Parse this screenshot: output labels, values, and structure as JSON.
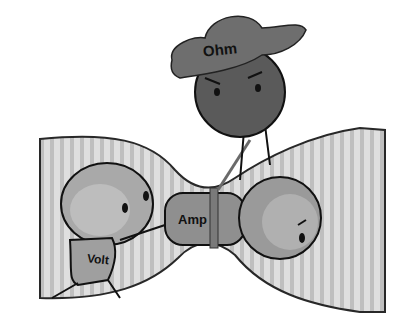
{
  "illustration": {
    "subject": "Ohm's law cartoon",
    "characters": [
      {
        "name": "Ohm",
        "label": "Ohm",
        "role": "resistance, squeezing the pipe with a rope, wearing a hat"
      },
      {
        "name": "Volt",
        "label": "Volt",
        "role": "voltage, pushing"
      },
      {
        "name": "Amp",
        "label": "Amp",
        "role": "current, squeezing through the narrow pipe"
      }
    ],
    "colors": {
      "background": "#ffffff",
      "pipe_fill": "#d6d6d6",
      "pipe_stripe": "#b8b8b8",
      "ohm_body": "#5a5a5a",
      "ohm_hat": "#6e6e6e",
      "volt_body": "#a9a9a9",
      "amp_body": "#8f8f8f",
      "outline": "#111111"
    }
  }
}
